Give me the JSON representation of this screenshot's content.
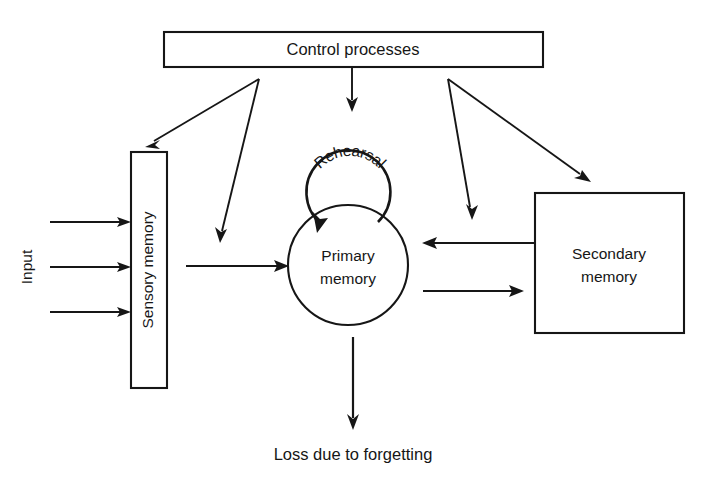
{
  "diagram": {
    "accent_color": "#161616",
    "background_color": "#ffffff",
    "nodes": {
      "control": {
        "label": "Control processes",
        "shape": "rectangle"
      },
      "sensory": {
        "label": "Sensory memory",
        "shape": "rectangle",
        "orientation": "vertical"
      },
      "primary": {
        "label_line1": "Primary",
        "label_line2": "memory",
        "shape": "circle"
      },
      "secondary": {
        "label_line1": "Secondary",
        "label_line2": "memory",
        "shape": "square"
      },
      "rehearsal": {
        "label": "Rehearsal",
        "shape": "loop"
      }
    },
    "labels": {
      "input": "Input",
      "loss": "Loss due to forgetting"
    },
    "edges": [
      {
        "name": "input-1",
        "from": "input",
        "to": "sensory"
      },
      {
        "name": "input-2",
        "from": "input",
        "to": "sensory"
      },
      {
        "name": "input-3",
        "from": "input",
        "to": "sensory"
      },
      {
        "name": "sensory-to-primary",
        "from": "sensory",
        "to": "primary"
      },
      {
        "name": "control-to-sensory",
        "from": "control",
        "to": "sensory"
      },
      {
        "name": "control-to-sensory-output",
        "from": "control",
        "to": "sensory-to-primary"
      },
      {
        "name": "control-to-rehearsal",
        "from": "control",
        "to": "rehearsal"
      },
      {
        "name": "control-to-primary-secondary",
        "from": "control",
        "to": "primary-secondary-link"
      },
      {
        "name": "control-to-secondary",
        "from": "control",
        "to": "secondary"
      },
      {
        "name": "secondary-to-primary",
        "from": "secondary",
        "to": "primary"
      },
      {
        "name": "primary-to-secondary",
        "from": "primary",
        "to": "secondary"
      },
      {
        "name": "primary-to-loss",
        "from": "primary",
        "to": "loss"
      },
      {
        "name": "rehearsal-loop",
        "from": "primary",
        "to": "primary"
      }
    ]
  }
}
